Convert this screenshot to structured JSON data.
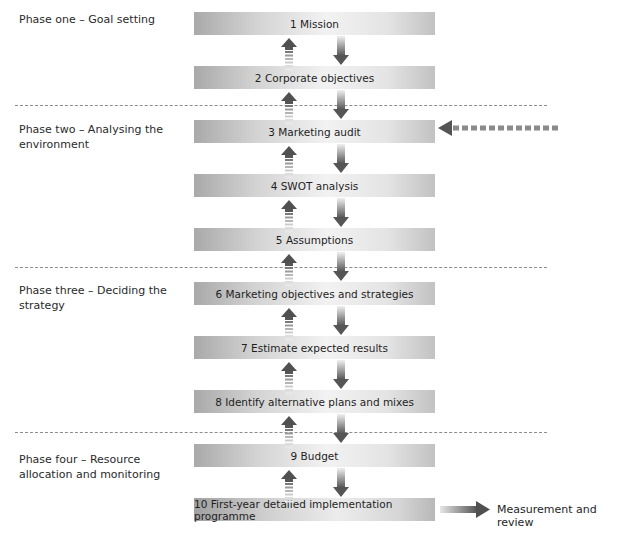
{
  "phases": [
    {
      "label": "Phase one – Goal setting"
    },
    {
      "label": "Phase two – Analysing the environment"
    },
    {
      "label": "Phase three – Deciding the strategy"
    },
    {
      "label": "Phase four – Resource allocation and monitoring"
    }
  ],
  "steps": [
    {
      "label": "1 Mission"
    },
    {
      "label": "2 Corporate objectives"
    },
    {
      "label": "3 Marketing audit"
    },
    {
      "label": "4 SWOT analysis"
    },
    {
      "label": "5 Assumptions"
    },
    {
      "label": "6 Marketing objectives and strategies"
    },
    {
      "label": "7 Estimate expected results"
    },
    {
      "label": "8 Identify alternative plans and mixes"
    },
    {
      "label": "9 Budget"
    },
    {
      "label": "10 First-year detailed implementation programme"
    }
  ],
  "output": {
    "label": "Measurement and review"
  },
  "feedback": {
    "from": "Measurement and review",
    "to": "3 Marketing audit",
    "style": "dashed"
  },
  "colors": {
    "arrow_dark": "#555555",
    "separator": "#8c8c8c",
    "feedback": "#8a8a8a"
  }
}
